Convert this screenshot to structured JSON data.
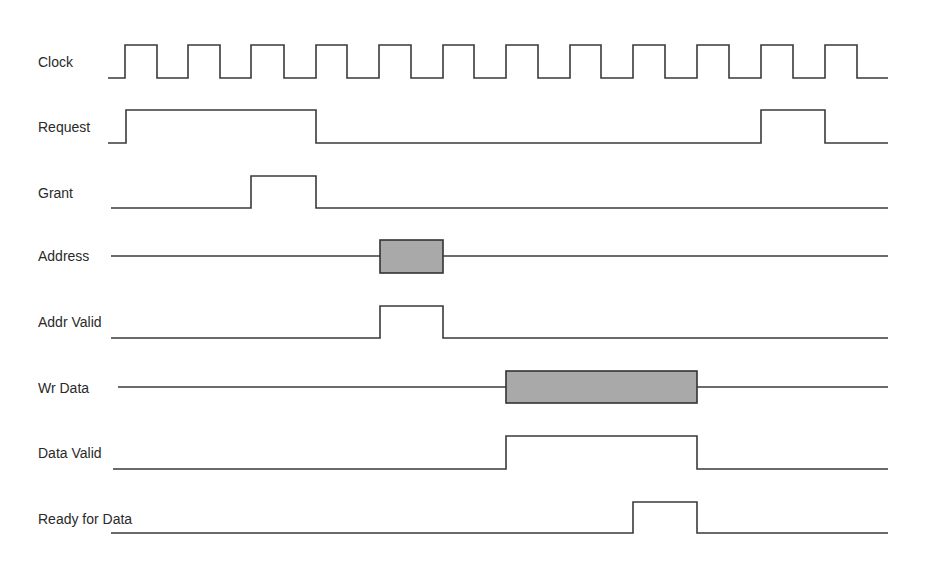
{
  "diagram": {
    "type": "timing-diagram",
    "x_end": 888,
    "signals": [
      {
        "name": "Clock",
        "kind": "digital",
        "label_x": 38,
        "label_y": 54,
        "low_y": 78,
        "high_y": 45,
        "start_x": 108,
        "edges": [
          125,
          157,
          188,
          220,
          251,
          284,
          316,
          347,
          379,
          411,
          443,
          474,
          506,
          538,
          570,
          601,
          633,
          665,
          697,
          729,
          761,
          793,
          825,
          857
        ],
        "initial": 0
      },
      {
        "name": "Request",
        "kind": "digital",
        "label_x": 38,
        "label_y": 119,
        "low_y": 143,
        "high_y": 110,
        "start_x": 108,
        "edges": [
          126,
          316,
          761,
          825
        ],
        "initial": 0
      },
      {
        "name": "Grant",
        "kind": "digital",
        "label_x": 38,
        "label_y": 185,
        "low_y": 208,
        "high_y": 176,
        "start_x": 111,
        "edges": [
          251,
          316
        ],
        "initial": 0
      },
      {
        "name": "Address",
        "kind": "bus",
        "label_x": 38,
        "label_y": 248,
        "line_y": 256,
        "start_x": 111,
        "boxes": [
          {
            "x1": 380,
            "x2": 443,
            "top": 240,
            "bottom": 273
          }
        ]
      },
      {
        "name": "Addr Valid",
        "kind": "digital",
        "label_x": 38,
        "label_y": 314,
        "low_y": 338,
        "high_y": 306,
        "start_x": 111,
        "edges": [
          380,
          443
        ],
        "initial": 0
      },
      {
        "name": "Wr Data",
        "kind": "bus",
        "label_x": 38,
        "label_y": 380,
        "line_y": 387,
        "start_x": 118,
        "boxes": [
          {
            "x1": 506,
            "x2": 697,
            "top": 371,
            "bottom": 403
          }
        ]
      },
      {
        "name": "Data Valid",
        "kind": "digital",
        "label_x": 38,
        "label_y": 445,
        "low_y": 469,
        "high_y": 436,
        "start_x": 113,
        "edges": [
          506,
          697
        ],
        "initial": 0
      },
      {
        "name": "Ready for Data",
        "kind": "digital",
        "label_x": 38,
        "label_y": 511,
        "low_y": 533,
        "high_y": 502,
        "start_x": 111,
        "edges": [
          633,
          697
        ],
        "initial": 0
      }
    ],
    "colors": {
      "line": "#3a3a3a",
      "bus_fill": "#a9a9a9",
      "text": "#2a2a2a"
    }
  },
  "labels": {
    "clock": "Clock",
    "request": "Request",
    "grant": "Grant",
    "address": "Address",
    "addr_valid": "Addr Valid",
    "wr_data": "Wr Data",
    "data_valid": "Data Valid",
    "ready_for_data": "Ready for Data"
  }
}
